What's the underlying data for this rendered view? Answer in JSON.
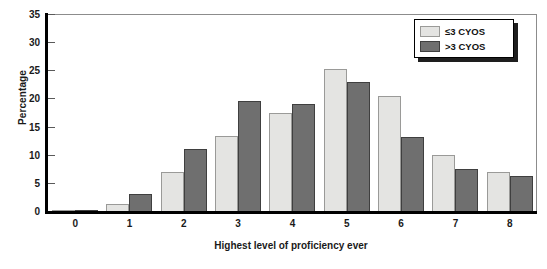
{
  "chart_data": {
    "type": "bar",
    "title": "",
    "xlabel": "Highest level of proficiency ever",
    "ylabel": "Percentage",
    "categories": [
      "0",
      "1",
      "2",
      "3",
      "4",
      "5",
      "6",
      "7",
      "8"
    ],
    "series": [
      {
        "name": "≤3 CYOS",
        "color": "#e4e4e2",
        "values": [
          0.2,
          1.3,
          7.0,
          13.4,
          17.4,
          25.3,
          20.5,
          9.9,
          7.0
        ]
      },
      {
        "name": ">3 CYOS",
        "color": "#6f6f6f",
        "values": [
          0.2,
          3.1,
          11.0,
          19.6,
          19.0,
          23.0,
          13.1,
          7.4,
          6.2
        ]
      }
    ],
    "ylim": [
      0,
      35
    ],
    "yticks": [
      0,
      5,
      10,
      15,
      20,
      25,
      30,
      35
    ],
    "ytick_labels": [
      "0",
      "5",
      "10",
      "15",
      "20",
      "25",
      "30",
      "35"
    ],
    "grid": false,
    "legend_position": "top-right"
  }
}
